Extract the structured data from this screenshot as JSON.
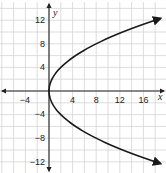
{
  "chart_data": {
    "type": "line",
    "title": "",
    "xlabel": "x",
    "ylabel": "y",
    "xlim": [
      -8,
      20
    ],
    "ylim": [
      -14,
      14
    ],
    "grid": true,
    "grid_step": 2,
    "x_ticks": [
      -4,
      4,
      8,
      12,
      16
    ],
    "y_ticks": [
      12,
      8,
      4,
      -4,
      -8,
      -12
    ],
    "x_tick_labels": [
      "−4",
      "4",
      "8",
      "12",
      "16"
    ],
    "y_tick_labels": [
      "12",
      "8",
      "4",
      "−4",
      "−8",
      "−12"
    ],
    "series": [
      {
        "name": "x = y²/8",
        "description": "Parabola opening to the right, vertex at origin, arrows at both ends",
        "points": [
          {
            "x": 18,
            "y": 12
          },
          {
            "x": 12.5,
            "y": 10
          },
          {
            "x": 8,
            "y": 8
          },
          {
            "x": 4.5,
            "y": 6
          },
          {
            "x": 2,
            "y": 4
          },
          {
            "x": 0.5,
            "y": 2
          },
          {
            "x": 0,
            "y": 0
          },
          {
            "x": 0.5,
            "y": -2
          },
          {
            "x": 2,
            "y": -4
          },
          {
            "x": 4.5,
            "y": -6
          },
          {
            "x": 8,
            "y": -8
          },
          {
            "x": 12.5,
            "y": -10
          },
          {
            "x": 18,
            "y": -12
          }
        ]
      }
    ],
    "colors": {
      "grid": "#d4d4d4",
      "axis": "#222222",
      "curve": "#1a1a1a",
      "background": "#ffffff"
    }
  },
  "labels": {
    "x_axis": "x",
    "y_axis": "y",
    "xt0": "−4",
    "xt1": "4",
    "xt2": "8",
    "xt3": "12",
    "xt4": "16",
    "yt0": "12",
    "yt1": "8",
    "yt2": "4",
    "yt3": "−4",
    "yt4": "−8",
    "yt5": "−12"
  }
}
